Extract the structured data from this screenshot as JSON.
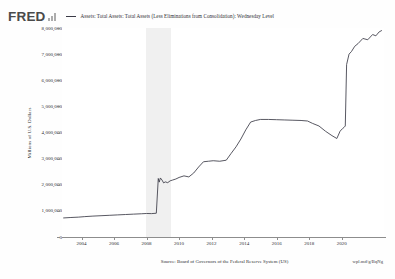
{
  "header": {
    "logo_text": "FRED",
    "logo_mark_icon": "bar-chart-icon",
    "legend_marker_icon": "line-swatch-icon",
    "legend_label": "Assets: Total Assets: Total Assets (Less Eliminations from Consolidation): Wednesday Level"
  },
  "footer": {
    "source": "Source: Board of Governors of the Federal Reserve System (US)",
    "short_link": "wpl.md/g/BqNg"
  },
  "axes": {
    "y_title": "Millions of U.S. Dollars",
    "y_ticks": [
      "8,000,000",
      "7,000,000",
      "6,000,000",
      "5,000,000",
      "4,000,000",
      "3,000,000",
      "2,000,000",
      "1,000,000",
      "0"
    ],
    "x_ticks": [
      "2004",
      "2006",
      "2008",
      "2010",
      "2012",
      "2014",
      "2016",
      "2018",
      "2020"
    ]
  },
  "colors": {
    "line": "#3a3a46",
    "axis": "#8d8d8d",
    "recession_band": "#f0f0f0",
    "text": "#2b2b30",
    "logo": "#4a4a4a",
    "plot_bg": "#ffffff"
  },
  "chart_data": {
    "type": "line",
    "title": "Assets: Total Assets: Total Assets (Less Eliminations from Consolidation): Wednesday Level",
    "xlabel": "",
    "ylabel": "Millions of U.S. Dollars",
    "xlim": [
      2002.8,
      2022.6
    ],
    "ylim": [
      0,
      8000000
    ],
    "ytick_values": [
      0,
      1000000,
      2000000,
      3000000,
      4000000,
      5000000,
      6000000,
      7000000,
      8000000
    ],
    "xtick_values": [
      2004,
      2006,
      2008,
      2010,
      2012,
      2014,
      2016,
      2018,
      2020
    ],
    "grid": false,
    "legend_position": "top",
    "shaded_regions": [
      {
        "label": "recession",
        "x0": 2007.95,
        "x1": 2009.5,
        "color": "#f0f0f0"
      }
    ],
    "series": [
      {
        "name": "Assets: Total Assets: Total Assets (Less Eliminations from Consolidation): Wednesday Level",
        "color": "#3a3a46",
        "x": [
          2002.9,
          2003.3,
          2003.8,
          2004.2,
          2004.7,
          2005.2,
          2005.7,
          2006.2,
          2006.7,
          2007.2,
          2007.7,
          2008.0,
          2008.3,
          2008.6,
          2008.72,
          2008.78,
          2008.85,
          2008.95,
          2009.05,
          2009.15,
          2009.3,
          2009.45,
          2009.6,
          2009.8,
          2010.0,
          2010.3,
          2010.6,
          2010.9,
          2011.2,
          2011.5,
          2011.8,
          2012.1,
          2012.5,
          2012.9,
          2013.2,
          2013.5,
          2013.8,
          2014.1,
          2014.4,
          2014.7,
          2015.0,
          2015.5,
          2016.0,
          2016.5,
          2017.0,
          2017.5,
          2017.9,
          2018.2,
          2018.6,
          2019.0,
          2019.4,
          2019.7,
          2019.9,
          2020.05,
          2020.15,
          2020.22,
          2020.3,
          2020.45,
          2020.6,
          2020.8,
          2021.0,
          2021.3,
          2021.6,
          2021.9,
          2022.1,
          2022.3,
          2022.45
        ],
        "y": [
          730000,
          745000,
          760000,
          780000,
          800000,
          815000,
          830000,
          845000,
          860000,
          875000,
          890000,
          900000,
          895000,
          910000,
          2240000,
          2100000,
          2260000,
          2180000,
          2070000,
          2110000,
          2080000,
          2150000,
          2180000,
          2220000,
          2280000,
          2340000,
          2300000,
          2450000,
          2680000,
          2880000,
          2900000,
          2920000,
          2900000,
          2940000,
          3200000,
          3450000,
          3750000,
          4100000,
          4400000,
          4460000,
          4500000,
          4500000,
          4490000,
          4480000,
          4470000,
          4460000,
          4440000,
          4350000,
          4250000,
          4050000,
          3880000,
          3770000,
          4050000,
          4150000,
          4200000,
          4250000,
          6600000,
          7000000,
          7100000,
          7300000,
          7400000,
          7600000,
          7550000,
          7750000,
          7700000,
          7850000,
          7900000
        ]
      }
    ]
  }
}
